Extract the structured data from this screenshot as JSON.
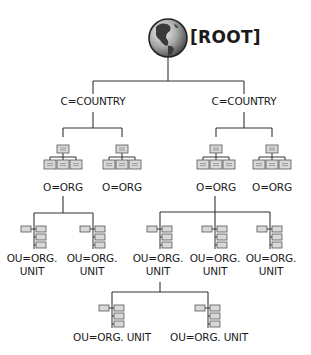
{
  "root": {
    "label": "[ROOT]",
    "icon": "globe-icon"
  },
  "countries": [
    {
      "label": "C=COUNTRY"
    },
    {
      "label": "C=COUNTRY"
    }
  ],
  "orgs": [
    {
      "label": "O=ORG"
    },
    {
      "label": "O=ORG"
    },
    {
      "label": "O=ORG"
    },
    {
      "label": "O=ORG"
    }
  ],
  "org_units": [
    {
      "line1": "OU=ORG.",
      "line2": "UNIT"
    },
    {
      "line1": "OU=ORG.",
      "line2": "UNIT"
    },
    {
      "line1": "OU=ORG.",
      "line2": "UNIT"
    },
    {
      "line1": "OU=ORG.",
      "line2": "UNIT"
    },
    {
      "line1": "OU=ORG.",
      "line2": "UNIT"
    }
  ],
  "sub_org_units": [
    {
      "label": "OU=ORG. UNIT"
    },
    {
      "label": "OU=ORG. UNIT"
    }
  ],
  "colors": {
    "line": "#333333",
    "box_fill": "#d8d8d8",
    "box_stroke": "#555555",
    "globe_dark": "#3a3a3a",
    "globe_light": "#bdbdbd"
  }
}
